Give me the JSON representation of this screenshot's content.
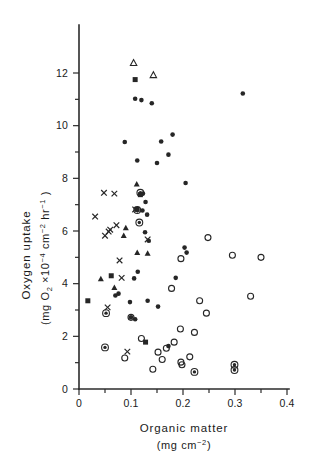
{
  "chart_data": {
    "type": "scatter",
    "title": "",
    "xlabel": "Organic matter",
    "xlabel_units": "(mg cm-2)",
    "ylabel": "Oxygen uptake",
    "ylabel_units": "(mg O2 x10-4 cm-2 hr-1)",
    "xlim": [
      0,
      0.4
    ],
    "ylim": [
      0,
      13
    ],
    "xticks": [
      0,
      0.1,
      0.2,
      0.3,
      0.4
    ],
    "xticklabels": [
      "0",
      "0.1",
      "0.2",
      "0.3",
      "0.4"
    ],
    "yticks": [
      0,
      2,
      4,
      6,
      8,
      10,
      12
    ],
    "yticklabels": [
      "0",
      "2",
      "4",
      "6",
      "8",
      "10",
      "12"
    ],
    "xminorticks": [
      0.05,
      0.15,
      0.25,
      0.35
    ],
    "yminorticks": [
      1,
      3,
      5,
      7,
      9,
      11
    ],
    "grid": false,
    "legend": "none",
    "marker_color": "#262626",
    "series": [
      {
        "name": "filled-circle",
        "marker": "filled-circle",
        "points": [
          [
            0.108,
            11.02
          ],
          [
            0.12,
            10.97
          ],
          [
            0.14,
            10.85
          ],
          [
            0.088,
            9.38
          ],
          [
            0.158,
            9.4
          ],
          [
            0.18,
            9.66
          ],
          [
            0.112,
            8.68
          ],
          [
            0.15,
            8.58
          ],
          [
            0.172,
            8.9
          ],
          [
            0.205,
            7.82
          ],
          [
            0.123,
            7.42
          ],
          [
            0.128,
            7.1
          ],
          [
            0.122,
            6.78
          ],
          [
            0.131,
            6.62
          ],
          [
            0.127,
            5.95
          ],
          [
            0.134,
            5.63
          ],
          [
            0.203,
            5.37
          ],
          [
            0.207,
            5.18
          ],
          [
            0.113,
            4.45
          ],
          [
            0.106,
            4.2
          ],
          [
            0.076,
            3.62
          ],
          [
            0.07,
            3.55
          ],
          [
            0.098,
            3.3
          ],
          [
            0.132,
            3.35
          ],
          [
            0.152,
            3.13
          ],
          [
            0.1,
            2.72
          ],
          [
            0.108,
            2.65
          ],
          [
            0.172,
            1.63
          ],
          [
            0.315,
            11.22
          ],
          [
            0.186,
            4.22
          ]
        ]
      },
      {
        "name": "filled-square",
        "marker": "filled-square",
        "points": [
          [
            0.108,
            11.75
          ],
          [
            0.017,
            3.35
          ],
          [
            0.062,
            4.3
          ],
          [
            0.118,
            7.38
          ],
          [
            0.112,
            6.82
          ],
          [
            0.128,
            1.78
          ]
        ]
      },
      {
        "name": "filled-triangle",
        "marker": "filled-triangle",
        "points": [
          [
            0.111,
            7.78
          ],
          [
            0.09,
            6.12
          ],
          [
            0.086,
            5.82
          ],
          [
            0.112,
            5.18
          ],
          [
            0.132,
            5.15
          ],
          [
            0.042,
            4.18
          ],
          [
            0.068,
            3.85
          ]
        ]
      },
      {
        "name": "open-triangle",
        "marker": "open-triangle",
        "points": [
          [
            0.105,
            12.38
          ],
          [
            0.143,
            11.92
          ]
        ]
      },
      {
        "name": "cross",
        "marker": "cross",
        "points": [
          [
            0.048,
            7.45
          ],
          [
            0.068,
            7.42
          ],
          [
            0.031,
            6.55
          ],
          [
            0.072,
            6.22
          ],
          [
            0.06,
            6.05
          ],
          [
            0.057,
            5.98
          ],
          [
            0.05,
            5.82
          ],
          [
            0.108,
            6.82
          ],
          [
            0.132,
            5.68
          ],
          [
            0.078,
            4.88
          ],
          [
            0.082,
            4.22
          ],
          [
            0.055,
            3.1
          ],
          [
            0.093,
            1.42
          ]
        ]
      },
      {
        "name": "open-circle",
        "marker": "open-circle",
        "points": [
          [
            0.248,
            5.75
          ],
          [
            0.295,
            5.08
          ],
          [
            0.35,
            5.0
          ],
          [
            0.196,
            4.95
          ],
          [
            0.33,
            3.52
          ],
          [
            0.178,
            3.82
          ],
          [
            0.232,
            3.35
          ],
          [
            0.245,
            2.88
          ],
          [
            0.195,
            2.28
          ],
          [
            0.222,
            2.15
          ],
          [
            0.183,
            1.78
          ],
          [
            0.168,
            1.55
          ],
          [
            0.213,
            1.22
          ],
          [
            0.196,
            1.02
          ],
          [
            0.198,
            0.92
          ],
          [
            0.1,
            2.72
          ],
          [
            0.152,
            1.4
          ],
          [
            0.088,
            1.18
          ],
          [
            0.16,
            1.12
          ],
          [
            0.142,
            0.75
          ],
          [
            0.12,
            1.92
          ]
        ]
      },
      {
        "name": "dot-in-circle",
        "marker": "dot-in-circle",
        "points": [
          [
            0.118,
            7.45
          ],
          [
            0.112,
            6.8
          ],
          [
            0.116,
            6.32
          ],
          [
            0.052,
            2.88
          ],
          [
            0.05,
            1.58
          ],
          [
            0.222,
            0.65
          ],
          [
            0.299,
            0.92
          ],
          [
            0.299,
            0.72
          ]
        ]
      }
    ]
  },
  "figure": {
    "background_color": "#ffffff",
    "foreground_color": "#262626"
  }
}
